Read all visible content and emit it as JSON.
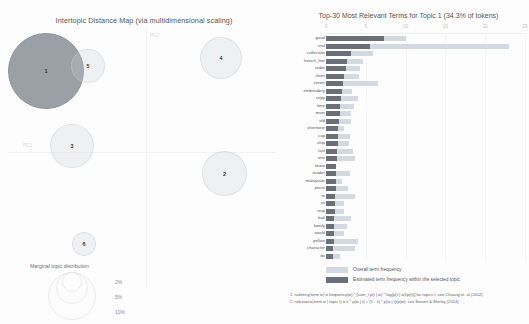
{
  "left": {
    "title": "Intertopic Distance Map (via multidimensional scaling)",
    "axis_labels": {
      "pc1": "PC1",
      "pc2": "PC2"
    },
    "marginal_legend": {
      "caption": "Marginal topic distribution",
      "sizes": [
        "2%",
        "5%",
        "10%"
      ]
    },
    "topics": [
      {
        "id": "1",
        "label": "1",
        "selected": true
      },
      {
        "id": "2",
        "label": "2",
        "selected": false
      },
      {
        "id": "3",
        "label": "3",
        "selected": false
      },
      {
        "id": "4",
        "label": "4",
        "selected": false
      },
      {
        "id": "5",
        "label": "5",
        "selected": false
      },
      {
        "id": "6",
        "label": "6",
        "selected": false
      }
    ]
  },
  "right": {
    "title": "Top-30 Most Relevant Terms for Topic 1 (34.3% of tokens)",
    "legend": {
      "overall": "Overall term frequency",
      "estimated": "Estimated term frequency within the selected topic"
    },
    "notes": [
      "1. saliency(term w) = frequency(w) * [sum_t p(t | w) * log(p(t | w)/p(t))] for topics t; see Chuang et. al (2012)",
      "2. relevance(term w | topic t) = λ * p(w | t) + (1 - λ) * p(w | t)/p(w); see Sievert & Shirley (2014)"
    ]
  },
  "chart_data": {
    "type": "bar",
    "title": "Top-30 Most Relevant Terms for Topic 1 (34.3% of tokens)",
    "orientation": "horizontal",
    "xlabel": "",
    "ylabel": "",
    "xlim": [
      0,
      25
    ],
    "xticks": [
      0,
      5,
      10,
      15,
      20,
      25
    ],
    "grid": true,
    "legend_position": "bottom-left",
    "categories": [
      "good",
      "real",
      "collection",
      "french_line",
      "order",
      "short",
      "series",
      "embroidery",
      "copy",
      "time",
      "main",
      "old",
      "shorttone",
      "cup",
      "ship",
      "last",
      "one",
      "know",
      "reader",
      "malaysian",
      "piece",
      "to",
      "sit",
      "strip",
      "bali",
      "family",
      "world",
      "yellow",
      "character",
      "do"
    ],
    "series": [
      {
        "name": "Overall term frequency",
        "values": [
          10.0,
          23.0,
          5.9,
          4.6,
          4.3,
          4.1,
          6.5,
          3.3,
          4.0,
          3.5,
          3.1,
          3.1,
          2.2,
          3.0,
          2.9,
          3.4,
          3.6,
          1.2,
          3.0,
          2.0,
          2.8,
          3.6,
          2.2,
          2.3,
          3.1,
          2.6,
          2.3,
          4.0,
          3.7,
          1.8
        ]
      },
      {
        "name": "Estimated term frequency within the selected topic",
        "values": [
          7.3,
          5.5,
          3.1,
          2.7,
          2.5,
          2.3,
          2.1,
          2.0,
          1.9,
          1.8,
          1.7,
          1.6,
          1.55,
          1.5,
          1.45,
          1.4,
          1.35,
          1.3,
          1.25,
          1.2,
          1.2,
          1.15,
          1.1,
          1.1,
          1.05,
          1.0,
          1.0,
          0.95,
          0.9,
          0.85
        ]
      }
    ]
  },
  "colors": {
    "bar_overall": "#d3d9e0",
    "bar_topic": "#6b7078",
    "bubble_fill": "#c8ced6",
    "bubble_selected": "#9aa0a6"
  }
}
